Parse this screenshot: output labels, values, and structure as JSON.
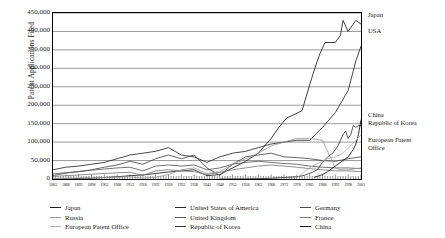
{
  "chart_data": {
    "type": "line",
    "title": "",
    "xlabel": "",
    "ylabel": "Patent Applications Filed",
    "ylim": [
      0,
      450000
    ],
    "ytick_labels": [
      "450,000",
      "400,000",
      "350,000",
      "300,000",
      "250,000",
      "200,000",
      "150,000",
      "100,000",
      "50,000",
      "0"
    ],
    "ytick_values": [
      450000,
      400000,
      350000,
      300000,
      250000,
      200000,
      150000,
      100000,
      50000,
      0
    ],
    "grid": true,
    "xlim": [
      1883,
      2003
    ],
    "x_tick_step": 1,
    "x_label_step": 5,
    "xtick_labels": [
      "1883",
      "1888",
      "1893",
      "1898",
      "1903",
      "1908",
      "1913",
      "1918",
      "1923",
      "1928",
      "1933",
      "1938",
      "1943",
      "1948",
      "1953",
      "1958",
      "1963",
      "1968",
      "1973",
      "1978",
      "1983",
      "1988",
      "1993",
      "1998",
      "2003"
    ],
    "legend_position": "bottom",
    "annotations": [
      {
        "text": "Japan",
        "value": 420000
      },
      {
        "text": "USA",
        "value": 360000
      },
      {
        "text": "China",
        "value": 160000
      },
      {
        "text": "Republic of Korea",
        "value": 145000
      },
      {
        "text": "European Patent",
        "value": 120000
      },
      {
        "text": "Office",
        "value": 120000
      }
    ],
    "series": [
      {
        "name": "Japan",
        "color": "#1f1f1f",
        "x": [
          1883,
          1888,
          1893,
          1898,
          1903,
          1908,
          1913,
          1918,
          1923,
          1928,
          1933,
          1938,
          1943,
          1948,
          1953,
          1958,
          1963,
          1968,
          1971,
          1974,
          1977,
          1980,
          1983,
          1985,
          1987,
          1989,
          1991,
          1993,
          1995,
          1996,
          1998,
          2000,
          2001,
          2003
        ],
        "values": [
          0,
          500,
          1500,
          2500,
          4000,
          6000,
          9000,
          11000,
          15000,
          19000,
          22000,
          25000,
          9000,
          12000,
          30000,
          48000,
          70000,
          110000,
          140000,
          165000,
          175000,
          185000,
          255000,
          300000,
          340000,
          370000,
          370000,
          370000,
          390000,
          430000,
          400000,
          420000,
          430000,
          420000
        ]
      },
      {
        "name": "United States of America",
        "color": "#2b2b2b",
        "x": [
          1883,
          1888,
          1893,
          1898,
          1903,
          1908,
          1913,
          1918,
          1923,
          1928,
          1933,
          1938,
          1943,
          1948,
          1953,
          1958,
          1963,
          1968,
          1973,
          1978,
          1983,
          1988,
          1993,
          1998,
          2001,
          2003
        ],
        "values": [
          25000,
          32000,
          35000,
          40000,
          45000,
          55000,
          65000,
          70000,
          75000,
          85000,
          65000,
          60000,
          45000,
          60000,
          70000,
          75000,
          85000,
          95000,
          100000,
          105000,
          105000,
          140000,
          180000,
          240000,
          320000,
          360000
        ]
      },
      {
        "name": "Germany",
        "color": "#4a4a4a",
        "x": [
          1883,
          1888,
          1893,
          1898,
          1903,
          1908,
          1913,
          1918,
          1923,
          1928,
          1933,
          1938,
          1943,
          1948,
          1953,
          1958,
          1963,
          1968,
          1973,
          1978,
          1983,
          1988,
          1993,
          1998,
          2003
        ],
        "values": [
          9000,
          16000,
          20000,
          25000,
          32000,
          38000,
          48000,
          40000,
          55000,
          65000,
          55000,
          65000,
          30000,
          10000,
          40000,
          60000,
          65000,
          70000,
          60000,
          58000,
          55000,
          50000,
          48000,
          55000,
          60000
        ]
      },
      {
        "name": "United Kingdom",
        "color": "#5a5a5a",
        "x": [
          1883,
          1888,
          1893,
          1898,
          1903,
          1908,
          1913,
          1918,
          1923,
          1928,
          1933,
          1938,
          1943,
          1948,
          1953,
          1958,
          1963,
          1968,
          1973,
          1978,
          1983,
          1988,
          1993,
          1998,
          2003
        ],
        "values": [
          14000,
          17000,
          20000,
          24000,
          27000,
          30000,
          32000,
          22000,
          35000,
          38000,
          35000,
          38000,
          25000,
          30000,
          40000,
          45000,
          48000,
          45000,
          42000,
          40000,
          35000,
          32000,
          30000,
          30000,
          28000
        ]
      },
      {
        "name": "France",
        "color": "#7a7a7a",
        "x": [
          1883,
          1888,
          1893,
          1898,
          1903,
          1908,
          1913,
          1918,
          1923,
          1928,
          1933,
          1938,
          1943,
          1948,
          1953,
          1958,
          1963,
          1968,
          1973,
          1978,
          1983,
          1988,
          1993,
          1998,
          2003
        ],
        "values": [
          7000,
          9000,
          11000,
          13000,
          15000,
          17000,
          18000,
          10000,
          22000,
          25000,
          22000,
          20000,
          12000,
          18000,
          25000,
          30000,
          35000,
          38000,
          35000,
          32000,
          28000,
          25000,
          22000,
          22000,
          20000
        ]
      },
      {
        "name": "Russia",
        "color": "#9a9a9a",
        "x": [
          1883,
          1888,
          1893,
          1898,
          1903,
          1908,
          1913,
          1918,
          1923,
          1928,
          1933,
          1938,
          1943,
          1948,
          1953,
          1958,
          1963,
          1968,
          1973,
          1978,
          1983,
          1988,
          1991,
          1993,
          1995,
          1998,
          2003
        ],
        "values": [
          1000,
          2000,
          2500,
          3000,
          4000,
          5000,
          6000,
          2000,
          5000,
          12000,
          25000,
          30000,
          15000,
          20000,
          40000,
          55000,
          70000,
          90000,
          100000,
          110000,
          110000,
          105000,
          60000,
          30000,
          25000,
          25000,
          30000
        ]
      },
      {
        "name": "Republic of Korea",
        "color": "#3a3a3a",
        "x": [
          1948,
          1958,
          1963,
          1968,
          1973,
          1978,
          1981,
          1984,
          1986,
          1988,
          1990,
          1992,
          1994,
          1996,
          1997,
          1998,
          1999,
          2000,
          2001,
          2002,
          2003
        ],
        "values": [
          0,
          500,
          1000,
          2000,
          4000,
          6000,
          10000,
          18000,
          25000,
          45000,
          60000,
          70000,
          90000,
          120000,
          130000,
          110000,
          120000,
          145000,
          140000,
          145000,
          145000
        ]
      },
      {
        "name": "China",
        "color": "#111111",
        "x": [
          1985,
          1988,
          1990,
          1992,
          1994,
          1996,
          1998,
          2000,
          2001,
          2002,
          2003
        ],
        "values": [
          5000,
          12000,
          20000,
          30000,
          40000,
          50000,
          60000,
          80000,
          95000,
          120000,
          160000
        ]
      },
      {
        "name": "European Patent Office",
        "color": "#b0b0b0",
        "x": [
          1978,
          1981,
          1984,
          1987,
          1990,
          1993,
          1996,
          1999,
          2001,
          2003
        ],
        "values": [
          3000,
          20000,
          35000,
          45000,
          55000,
          60000,
          70000,
          90000,
          105000,
          120000
        ]
      }
    ]
  },
  "legend": {
    "columns": [
      [
        {
          "label": "Japan",
          "color": "#1f1f1f"
        },
        {
          "label": "Russia",
          "color": "#9a9a9a"
        },
        {
          "label": "European Patent Office",
          "color": "#b0b0b0"
        }
      ],
      [
        {
          "label": "United States of America",
          "color": "#2b2b2b"
        },
        {
          "label": "United Kingdom",
          "color": "#5a5a5a"
        },
        {
          "label": "Republic of Korea",
          "color": "#3a3a3a"
        }
      ],
      [
        {
          "label": "Germany",
          "color": "#4a4a4a"
        },
        {
          "label": "France",
          "color": "#7a7a7a"
        },
        {
          "label": "China",
          "color": "#111111"
        }
      ]
    ]
  }
}
